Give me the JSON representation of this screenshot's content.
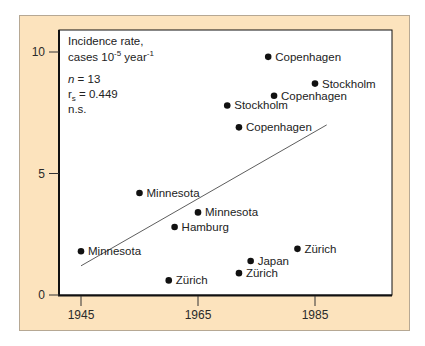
{
  "chart_data": {
    "type": "scatter",
    "title": "",
    "ylabel": "Incidence rate, cases 10-5 year-1",
    "xlabel": "",
    "xlim": [
      1939,
      1996
    ],
    "ylim": [
      0,
      10.4
    ],
    "x_ticks": [
      1945,
      1965,
      1985
    ],
    "y_ticks": [
      0,
      5,
      10
    ],
    "grid": false,
    "annotations": [
      "n = 13",
      "rs = 0.449",
      "n.s."
    ],
    "points": [
      {
        "label": "Copenhagen",
        "x": 1977,
        "y": 9.8
      },
      {
        "label": "Stockholm",
        "x": 1985,
        "y": 8.7
      },
      {
        "label": "Copenhagen",
        "x": 1978,
        "y": 8.2
      },
      {
        "label": "Stockholm",
        "x": 1970,
        "y": 7.8
      },
      {
        "label": "Copenhagen",
        "x": 1972,
        "y": 6.9
      },
      {
        "label": "Minnesota",
        "x": 1955,
        "y": 4.2
      },
      {
        "label": "Minnesota",
        "x": 1965,
        "y": 3.4
      },
      {
        "label": "Hamburg",
        "x": 1961,
        "y": 2.8
      },
      {
        "label": "Minnesota",
        "x": 1945,
        "y": 1.8
      },
      {
        "label": "Zürich",
        "x": 1982,
        "y": 1.9
      },
      {
        "label": "Japan",
        "x": 1974,
        "y": 1.4
      },
      {
        "label": "Zürich",
        "x": 1972,
        "y": 0.9
      },
      {
        "label": "Zürich",
        "x": 1960,
        "y": 0.6
      }
    ],
    "trend_line": {
      "x": [
        1945,
        1987
      ],
      "y": [
        1.2,
        7.0
      ]
    }
  },
  "info": {
    "line1": "Incidence rate,",
    "line2_a": "cases 10",
    "line2_sup1": "-5",
    "line2_b": " year",
    "line2_sup2": "-1",
    "n_italic": "n",
    "n_rest": " = 13",
    "rs_r": "r",
    "rs_sub": "s",
    "rs_rest": " = 0.449",
    "ns": "n.s."
  },
  "colors": {
    "frame_bg": "#fce3bd",
    "plot_bg": "#ffffff",
    "point": "#111111",
    "axis": "#111111"
  }
}
